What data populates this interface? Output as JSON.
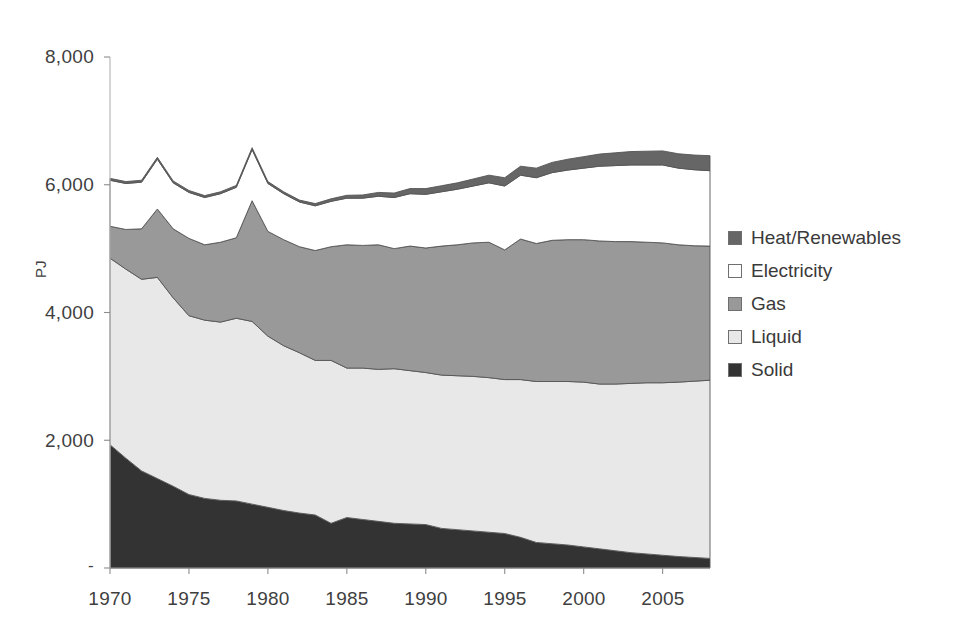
{
  "chart_data": {
    "type": "area",
    "title": "",
    "subtitle": "",
    "xlabel": "",
    "ylabel": "PJ",
    "stacked": true,
    "grid": false,
    "legend_position": "right",
    "xlim": [
      1970,
      2008
    ],
    "ylim": [
      0,
      8000
    ],
    "ytick_labels": [
      "8,000",
      "6,000",
      "4,000",
      "2,000",
      "-"
    ],
    "ytick_values": [
      8000,
      6000,
      4000,
      2000,
      0
    ],
    "xtick_labels": [
      "1970",
      "1975",
      "1980",
      "1985",
      "1990",
      "1995",
      "2000",
      "2005"
    ],
    "xtick_values": [
      1970,
      1975,
      1980,
      1985,
      1990,
      1995,
      2000,
      2005
    ],
    "x": [
      1970,
      1971,
      1972,
      1973,
      1974,
      1975,
      1976,
      1977,
      1978,
      1979,
      1980,
      1981,
      1982,
      1983,
      1984,
      1985,
      1986,
      1987,
      1988,
      1989,
      1990,
      1991,
      1992,
      1993,
      1994,
      1995,
      1996,
      1997,
      1998,
      1999,
      2000,
      2001,
      2002,
      2003,
      2004,
      2005,
      2006,
      2007,
      2008
    ],
    "series": [
      {
        "name": "Solid",
        "color": "#333333",
        "values": [
          1930,
          1720,
          1520,
          1400,
          1280,
          1150,
          1090,
          1060,
          1050,
          1000,
          950,
          900,
          860,
          830,
          700,
          790,
          760,
          730,
          700,
          690,
          680,
          620,
          600,
          580,
          560,
          540,
          480,
          400,
          380,
          360,
          330,
          300,
          270,
          240,
          220,
          200,
          180,
          165,
          150
        ]
      },
      {
        "name": "Liquid",
        "color": "#e8e8e8",
        "values": [
          2920,
          2960,
          3000,
          3150,
          2950,
          2800,
          2790,
          2790,
          2860,
          2860,
          2680,
          2580,
          2510,
          2420,
          2550,
          2340,
          2370,
          2380,
          2420,
          2400,
          2380,
          2400,
          2410,
          2420,
          2420,
          2410,
          2470,
          2520,
          2540,
          2560,
          2580,
          2580,
          2610,
          2650,
          2680,
          2700,
          2730,
          2760,
          2790
        ]
      },
      {
        "name": "Gas",
        "color": "#999999",
        "values": [
          500,
          620,
          790,
          1070,
          1080,
          1210,
          1180,
          1250,
          1260,
          1890,
          1640,
          1660,
          1660,
          1720,
          1780,
          1930,
          1920,
          1950,
          1880,
          1950,
          1950,
          2020,
          2050,
          2090,
          2120,
          2030,
          2200,
          2160,
          2210,
          2220,
          2230,
          2240,
          2230,
          2220,
          2200,
          2190,
          2150,
          2120,
          2100
        ]
      },
      {
        "name": "Electricity",
        "color": "#ffffff",
        "values": [
          720,
          720,
          730,
          780,
          720,
          720,
          740,
          760,
          790,
          800,
          750,
          720,
          700,
          700,
          710,
          730,
          740,
          760,
          800,
          820,
          840,
          850,
          870,
          890,
          930,
          1000,
          1000,
          1030,
          1060,
          1090,
          1120,
          1170,
          1190,
          1200,
          1210,
          1220,
          1200,
          1190,
          1180
        ]
      },
      {
        "name": "Heat/Renewables",
        "color": "#666666",
        "values": [
          30,
          30,
          30,
          30,
          30,
          30,
          30,
          30,
          30,
          30,
          30,
          30,
          30,
          35,
          40,
          45,
          50,
          60,
          70,
          80,
          90,
          95,
          100,
          110,
          120,
          130,
          140,
          150,
          160,
          170,
          180,
          190,
          200,
          210,
          215,
          220,
          225,
          230,
          235
        ]
      }
    ],
    "totals": [
      6100,
      6050,
      6070,
      6430,
      6060,
      5910,
      5830,
      5890,
      5990,
      6580,
      6050,
      5860,
      5760,
      5705,
      5780,
      5835,
      5840,
      5880,
      5870,
      5940,
      5940,
      5985,
      6030,
      6090,
      6150,
      6110,
      6290,
      6260,
      6350,
      6400,
      6440,
      6480,
      6500,
      6520,
      6525,
      6530,
      6485,
      6465,
      6455
    ]
  },
  "legend": {
    "items": [
      {
        "label": "Heat/Renewables",
        "color": "#666666"
      },
      {
        "label": "Electricity",
        "color": "#ffffff"
      },
      {
        "label": "Gas",
        "color": "#999999"
      },
      {
        "label": "Liquid",
        "color": "#e8e8e8"
      },
      {
        "label": "Solid",
        "color": "#333333"
      }
    ]
  },
  "axes": {
    "y_title": "PJ"
  }
}
